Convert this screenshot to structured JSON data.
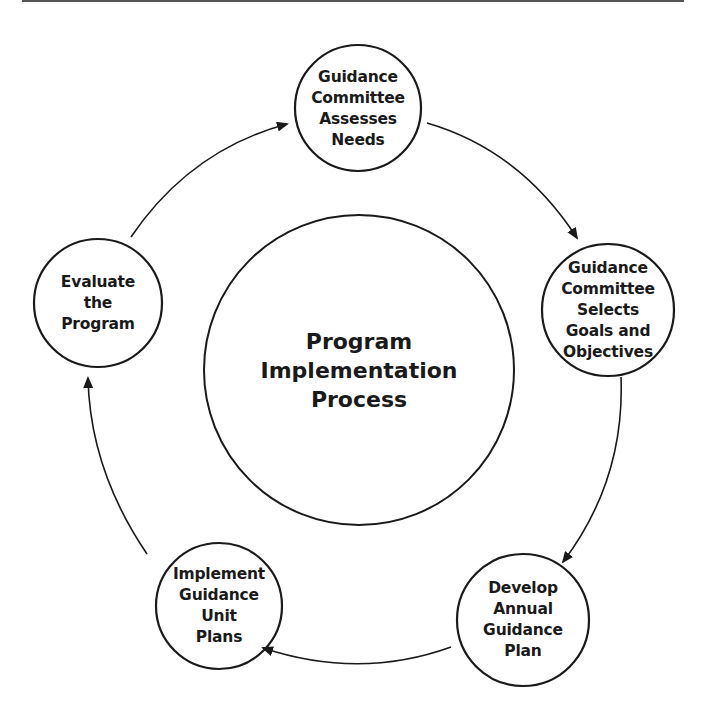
{
  "diagram": {
    "type": "cycle",
    "center": {
      "lines": [
        "Program",
        "Implementation",
        "Process"
      ]
    },
    "nodes": [
      {
        "id": "assess-needs",
        "lines": [
          "Guidance",
          "Committee",
          "Assesses",
          "Needs"
        ]
      },
      {
        "id": "select-goals",
        "lines": [
          "Guidance",
          "Committee",
          "Selects",
          "Goals and",
          "Objectives"
        ]
      },
      {
        "id": "develop-plan",
        "lines": [
          "Develop",
          "Annual",
          "Guidance",
          "Plan"
        ]
      },
      {
        "id": "implement-plans",
        "lines": [
          "Implement",
          "Guidance",
          "Unit",
          "Plans"
        ]
      },
      {
        "id": "evaluate-program",
        "lines": [
          "Evaluate",
          "the",
          "Program"
        ]
      }
    ],
    "flow": [
      {
        "from": "assess-needs",
        "to": "select-goals"
      },
      {
        "from": "select-goals",
        "to": "develop-plan"
      },
      {
        "from": "develop-plan",
        "to": "implement-plans"
      },
      {
        "from": "implement-plans",
        "to": "evaluate-program"
      },
      {
        "from": "evaluate-program",
        "to": "assess-needs"
      }
    ],
    "colors": {
      "stroke": "#1a1a1a",
      "text": "#1a1a1a",
      "background": "#ffffff"
    }
  }
}
